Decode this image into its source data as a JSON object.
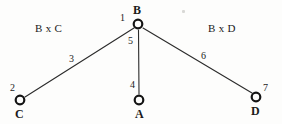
{
  "diagram": {
    "background_color": "#fdfdfc",
    "line_color": "#2b2b2b",
    "text_color": "#1b1b1b",
    "nodes": [
      {
        "id": "B",
        "label": "B",
        "number": "1",
        "x": 138,
        "y": 24
      },
      {
        "id": "C",
        "label": "C",
        "number": "2",
        "x": 20,
        "y": 100
      },
      {
        "id": "A",
        "label": "A",
        "number": "4",
        "x": 139,
        "y": 100
      },
      {
        "id": "D",
        "label": "D",
        "number": "7",
        "x": 256,
        "y": 97
      }
    ],
    "edges": [
      {
        "from": "B",
        "to": "C",
        "number": "3"
      },
      {
        "from": "B",
        "to": "A",
        "number": "5"
      },
      {
        "from": "B",
        "to": "D",
        "number": "6"
      }
    ],
    "region_labels": [
      {
        "text": "B x C",
        "x": 30,
        "y": 26
      },
      {
        "text": "B x D",
        "x": 203,
        "y": 26
      }
    ]
  },
  "labels": {
    "node_b_name": "B",
    "node_b_num": "1",
    "node_b_edge_num": "5",
    "node_c_name": "C",
    "node_c_num": "2",
    "node_a_name": "A",
    "node_a_num": "4",
    "node_d_name": "D",
    "node_d_num": "7",
    "edge_bc_num": "3",
    "edge_bd_num": "6",
    "region_left": "B x C",
    "region_right": "B x D"
  }
}
